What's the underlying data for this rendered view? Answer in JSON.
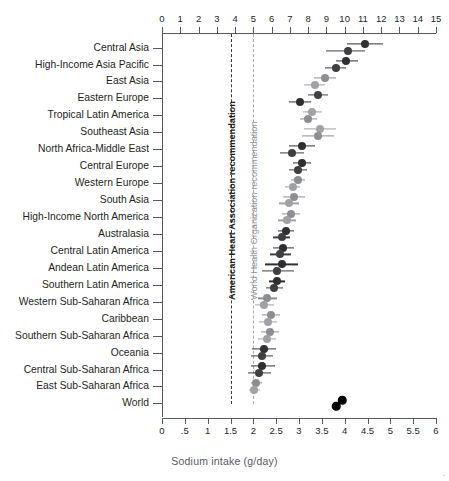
{
  "chart_data": {
    "type": "scatter",
    "title": "",
    "xlabel": "Sodium intake (g/day)",
    "ylabel": "",
    "top_axis": {
      "label": "",
      "ticks": [
        0,
        1,
        2,
        3,
        4,
        5,
        6,
        7,
        8,
        9,
        10,
        11,
        12,
        13,
        14,
        15
      ],
      "tick_labels": [
        "0",
        "1",
        "2",
        "3",
        "4",
        "5",
        "6",
        "7",
        "8",
        "9",
        "10",
        "11",
        "12",
        "13",
        "14",
        "15"
      ],
      "range": [
        0,
        15
      ],
      "unit_note": "g/day of salt (sodium chloride) equivalent"
    },
    "bottom_axis": {
      "label": "Sodium intake (g/day)",
      "ticks": [
        0,
        0.5,
        1,
        1.5,
        2,
        2.5,
        3,
        3.5,
        4,
        4.5,
        5,
        5.5,
        6
      ],
      "tick_labels": [
        "0",
        ".5",
        "1",
        "1.5",
        "2",
        "2.5",
        "3",
        "3.5",
        "4",
        "4.5",
        "5",
        "5.5",
        "6"
      ],
      "range": [
        0,
        6
      ]
    },
    "grid": false,
    "legend_position": "none",
    "series": [
      {
        "name": "men",
        "color": "#3f3f42"
      },
      {
        "name": "women",
        "color": "#a1a2a5"
      }
    ],
    "reference_lines": [
      {
        "label": "American Heart Association recommendation",
        "value": 1.5,
        "color": "#3a3a3c",
        "style": "dashed"
      },
      {
        "label": "World Health Organization recommendation",
        "value": 2.0,
        "color": "#a7a9ac",
        "style": "dashed"
      }
    ],
    "categories": [
      "Central Asia",
      "High-Income Asia Pacific",
      "East Asia",
      "Eastern Europe",
      "Tropical Latin America",
      "Southeast Asia",
      "North Africa-Middle East",
      "Central Europe",
      "Western Europe",
      "South Asia",
      "High-Income North America",
      "Australasia",
      "Central Latin America",
      "Andean Latin America",
      "Southern Latin America",
      "Western Sub-Saharan Africa",
      "Caribbean",
      "Southern Sub-Saharan Africa",
      "Oceania",
      "Central Sub-Saharan Africa",
      "East Sub-Saharan Africa",
      "World"
    ],
    "points": [
      {
        "category": "Central Asia",
        "series": "men",
        "x": 4.45,
        "lo": 4.05,
        "hi": 4.85,
        "series_color": "#2f2f32"
      },
      {
        "category": "Central Asia",
        "series": "women",
        "x": 4.07,
        "lo": 3.6,
        "hi": 4.45,
        "series_color": "#3f3f42"
      },
      {
        "category": "High-Income Asia Pacific",
        "series": "men",
        "x": 4.03,
        "lo": 3.8,
        "hi": 4.3,
        "series_color": "#2f2f32"
      },
      {
        "category": "High-Income Asia Pacific",
        "series": "women",
        "x": 3.8,
        "lo": 3.58,
        "hi": 4.02,
        "series_color": "#3f3f42"
      },
      {
        "category": "East Asia",
        "series": "men",
        "x": 3.56,
        "lo": 3.32,
        "hi": 3.82,
        "series_color": "#8d8e91"
      },
      {
        "category": "East Asia",
        "series": "women",
        "x": 3.34,
        "lo": 3.12,
        "hi": 3.58,
        "series_color": "#a1a2a5"
      },
      {
        "category": "Eastern Europe",
        "series": "men",
        "x": 3.42,
        "lo": 3.2,
        "hi": 3.64,
        "series_color": "#3f3f42"
      },
      {
        "category": "Eastern Europe",
        "series": "women",
        "x": 3.02,
        "lo": 2.78,
        "hi": 3.26,
        "series_color": "#2f2f32"
      },
      {
        "category": "Tropical Latin America",
        "series": "men",
        "x": 3.28,
        "lo": 3.08,
        "hi": 3.5,
        "series_color": "#a1a2a5"
      },
      {
        "category": "Tropical Latin America",
        "series": "women",
        "x": 3.2,
        "lo": 3.02,
        "hi": 3.4,
        "series_color": "#8d8e91"
      },
      {
        "category": "Southeast Asia",
        "series": "men",
        "x": 3.46,
        "lo": 3.1,
        "hi": 3.8,
        "series_color": "#a1a2a5"
      },
      {
        "category": "Southeast Asia",
        "series": "women",
        "x": 3.42,
        "lo": 3.06,
        "hi": 3.76,
        "series_color": "#8d8e91"
      },
      {
        "category": "North Africa-Middle East",
        "series": "men",
        "x": 3.06,
        "lo": 2.78,
        "hi": 3.36,
        "series_color": "#2f2f32"
      },
      {
        "category": "North Africa-Middle East",
        "series": "women",
        "x": 2.84,
        "lo": 2.58,
        "hi": 3.12,
        "series_color": "#3f3f42"
      },
      {
        "category": "Central Europe",
        "series": "men",
        "x": 3.06,
        "lo": 2.86,
        "hi": 3.26,
        "series_color": "#2f2f32"
      },
      {
        "category": "Central Europe",
        "series": "women",
        "x": 2.98,
        "lo": 2.78,
        "hi": 3.18,
        "series_color": "#3f3f42"
      },
      {
        "category": "Western Europe",
        "series": "men",
        "x": 2.98,
        "lo": 2.82,
        "hi": 3.14,
        "series_color": "#8d8e91"
      },
      {
        "category": "Western Europe",
        "series": "women",
        "x": 2.86,
        "lo": 2.7,
        "hi": 3.02,
        "series_color": "#a1a2a5"
      },
      {
        "category": "South Asia",
        "series": "men",
        "x": 2.9,
        "lo": 2.66,
        "hi": 3.14,
        "series_color": "#8d8e91"
      },
      {
        "category": "South Asia",
        "series": "women",
        "x": 2.78,
        "lo": 2.56,
        "hi": 3.0,
        "series_color": "#a1a2a5"
      },
      {
        "category": "High-Income North America",
        "series": "men",
        "x": 2.82,
        "lo": 2.62,
        "hi": 3.02,
        "series_color": "#8d8e91"
      },
      {
        "category": "High-Income North America",
        "series": "women",
        "x": 2.74,
        "lo": 2.54,
        "hi": 2.94,
        "series_color": "#a1a2a5"
      },
      {
        "category": "Australasia",
        "series": "men",
        "x": 2.72,
        "lo": 2.54,
        "hi": 2.9,
        "series_color": "#2f2f32"
      },
      {
        "category": "Australasia",
        "series": "women",
        "x": 2.62,
        "lo": 2.44,
        "hi": 2.8,
        "series_color": "#3f3f42"
      },
      {
        "category": "Central Latin America",
        "series": "men",
        "x": 2.66,
        "lo": 2.42,
        "hi": 2.9,
        "series_color": "#2f2f32"
      },
      {
        "category": "Central Latin America",
        "series": "women",
        "x": 2.58,
        "lo": 2.36,
        "hi": 2.82,
        "series_color": "#3f3f42"
      },
      {
        "category": "Andean Latin America",
        "series": "men",
        "x": 2.62,
        "lo": 2.26,
        "hi": 2.98,
        "series_color": "#2f2f32"
      },
      {
        "category": "Andean Latin America",
        "series": "women",
        "x": 2.52,
        "lo": 2.18,
        "hi": 2.88,
        "series_color": "#3f3f42"
      },
      {
        "category": "Southern Latin America",
        "series": "men",
        "x": 2.52,
        "lo": 2.34,
        "hi": 2.7,
        "series_color": "#2f2f32"
      },
      {
        "category": "Southern Latin America",
        "series": "women",
        "x": 2.46,
        "lo": 2.28,
        "hi": 2.64,
        "series_color": "#3f3f42"
      },
      {
        "category": "Western Sub-Saharan Africa",
        "series": "men",
        "x": 2.3,
        "lo": 2.1,
        "hi": 2.52,
        "series_color": "#8d8e91"
      },
      {
        "category": "Western Sub-Saharan Africa",
        "series": "women",
        "x": 2.24,
        "lo": 2.04,
        "hi": 2.46,
        "series_color": "#a1a2a5"
      },
      {
        "category": "Caribbean",
        "series": "men",
        "x": 2.38,
        "lo": 2.18,
        "hi": 2.58,
        "series_color": "#8d8e91"
      },
      {
        "category": "Caribbean",
        "series": "women",
        "x": 2.32,
        "lo": 2.12,
        "hi": 2.52,
        "series_color": "#a1a2a5"
      },
      {
        "category": "Southern Sub-Saharan Africa",
        "series": "men",
        "x": 2.36,
        "lo": 2.16,
        "hi": 2.56,
        "series_color": "#8d8e91"
      },
      {
        "category": "Southern Sub-Saharan Africa",
        "series": "women",
        "x": 2.3,
        "lo": 2.1,
        "hi": 2.5,
        "series_color": "#a1a2a5"
      },
      {
        "category": "Oceania",
        "series": "men",
        "x": 2.24,
        "lo": 1.98,
        "hi": 2.5,
        "series_color": "#2f2f32"
      },
      {
        "category": "Oceania",
        "series": "women",
        "x": 2.18,
        "lo": 1.94,
        "hi": 2.44,
        "series_color": "#3f3f42"
      },
      {
        "category": "Central Sub-Saharan Africa",
        "series": "men",
        "x": 2.2,
        "lo": 1.94,
        "hi": 2.48,
        "series_color": "#2f2f32"
      },
      {
        "category": "Central Sub-Saharan Africa",
        "series": "women",
        "x": 2.12,
        "lo": 1.88,
        "hi": 2.38,
        "series_color": "#3f3f42"
      },
      {
        "category": "East Sub-Saharan Africa",
        "series": "men",
        "x": 2.06,
        "lo": 1.94,
        "hi": 2.18,
        "series_color": "#8d8e91"
      },
      {
        "category": "East Sub-Saharan Africa",
        "series": "women",
        "x": 2.02,
        "lo": 1.9,
        "hi": 2.14,
        "series_color": "#a1a2a5"
      },
      {
        "category": "World",
        "series": "men",
        "x": 3.95,
        "lo": 3.95,
        "hi": 3.95,
        "series_color": "#000000"
      },
      {
        "category": "World",
        "series": "women",
        "x": 3.82,
        "lo": 3.82,
        "hi": 3.82,
        "series_color": "#000000"
      }
    ]
  }
}
